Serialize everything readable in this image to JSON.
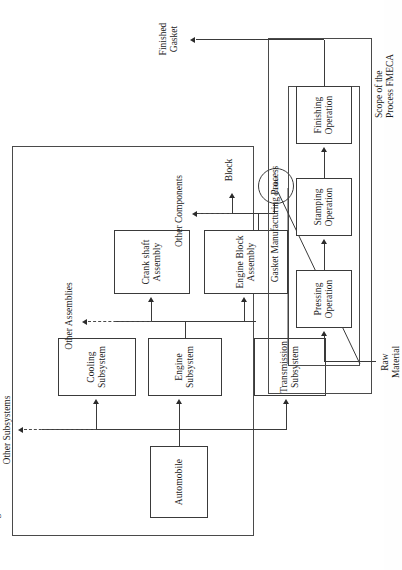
{
  "figure": {
    "title_present": false,
    "type": "block-diagram",
    "orientation": "rotated-90-ccw"
  },
  "scopes": [
    {
      "id": "design",
      "label": "Scope of the\nDesign FMECA"
    },
    {
      "id": "process",
      "label": "Scope of the\nProcess FMECA"
    }
  ],
  "design_blocks": [
    {
      "id": "automobile",
      "label": "Automobile"
    },
    {
      "id": "engine",
      "label": "Engine\nSubsystem"
    },
    {
      "id": "cooling",
      "label": "Cooling\nSubsystem"
    },
    {
      "id": "transmission",
      "label": "Transmission\nSubsystem"
    },
    {
      "id": "crankshaft",
      "label": "Crank shaft\nAssembly"
    },
    {
      "id": "engine-block",
      "label": "Engine Block\nAssembly"
    }
  ],
  "design_labels": [
    {
      "id": "other-subsystems",
      "label": "Other Subsystems"
    },
    {
      "id": "other-assemblies",
      "label": "Other Assemblies"
    },
    {
      "id": "other-components",
      "label": "Other Components"
    },
    {
      "id": "block",
      "label": "Block"
    }
  ],
  "gasket_node": {
    "label": "Gasket"
  },
  "process": {
    "group_label": "Gasket Manufacturing Process",
    "input_label": "Raw\nMaterial",
    "output_label": "Finished\nGasket",
    "operations": [
      {
        "id": "pressing",
        "label": "Pressing\nOperation"
      },
      {
        "id": "stamping",
        "label": "Stamping\nOperation"
      },
      {
        "id": "finishing",
        "label": "Finishing\nOperation"
      }
    ]
  },
  "colors": {
    "stroke": "#3a3a3a",
    "text": "#1a1a1a",
    "background": "#ffffff"
  }
}
